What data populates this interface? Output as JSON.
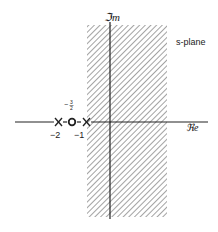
{
  "diagram": {
    "title": "s-plane",
    "axes": {
      "imag_label": "ℑm",
      "imag_label_text": "Im",
      "real_label": "ℜe",
      "real_label_text": "Re"
    },
    "region": {
      "description": "hatched strip of convergence",
      "left_boundary_real": -1,
      "right_boundary": "right side"
    },
    "poles": [
      {
        "marker": "X",
        "value": -2,
        "label": "−2"
      },
      {
        "marker": "X",
        "value": -1,
        "label": "−1"
      }
    ],
    "zeros": [
      {
        "marker": "O",
        "value": -1.5,
        "label_num": "3",
        "label_den": "2",
        "label_sign": "−"
      }
    ],
    "tick_labels": {
      "minus_two": "−2",
      "minus_one": "−1",
      "minus_three_halves_sign": "−",
      "minus_three_halves_num": "3",
      "minus_three_halves_den": "2"
    },
    "colors": {
      "ink": "#222222",
      "hatch": "#555555",
      "background": "#ffffff"
    }
  }
}
